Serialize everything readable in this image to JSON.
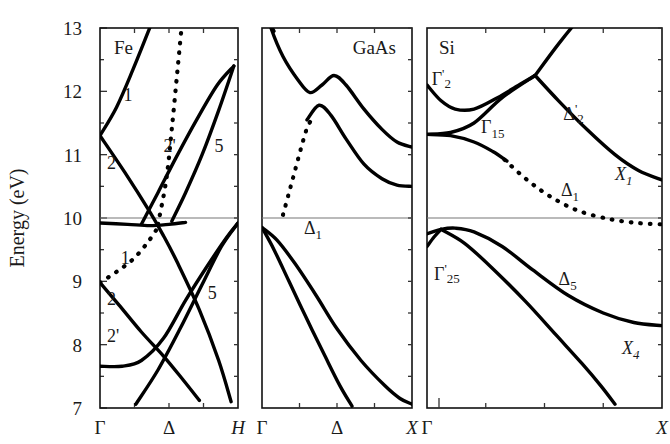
{
  "figure": {
    "y_axis_title": "Energy (eV)",
    "y_ticks": [
      "13",
      "12",
      "11",
      "10",
      "9",
      "8",
      "7"
    ],
    "y_range": [
      7,
      13
    ]
  },
  "chart_data": {
    "type": "line",
    "title": "Energy (eV)",
    "ylabel": "Energy (eV)",
    "xlabel": "",
    "ylim": [
      7,
      13
    ],
    "grid": false,
    "legend": "none",
    "panels": [
      {
        "name": "Fe",
        "xlabel_ticks": [
          "Γ",
          "Δ",
          "H"
        ],
        "x_range": [
          "Γ",
          "H"
        ],
        "annotations": [
          "1",
          "2",
          "2'",
          "5",
          "1",
          "2",
          "2'",
          "5"
        ],
        "series": [
          {
            "name": "Fe-cb-1",
            "style": "solid",
            "points": [
              [
                0.0,
                11.3
              ],
              [
                0.12,
                11.75
              ],
              [
                0.24,
                12.35
              ],
              [
                0.36,
                13.0
              ],
              [
                0.44,
                13.45
              ]
            ]
          },
          {
            "name": "Fe-cb-2",
            "style": "solid",
            "points": [
              [
                0.0,
                11.3
              ],
              [
                0.18,
                10.72
              ],
              [
                0.36,
                10.1
              ],
              [
                0.46,
                9.72
              ],
              [
                0.56,
                9.3
              ],
              [
                0.72,
                8.55
              ],
              [
                0.86,
                7.75
              ],
              [
                0.95,
                7.1
              ]
            ]
          },
          {
            "name": "Fe-cb-2prime",
            "style": "solid",
            "points": [
              [
                0.3,
                9.9
              ],
              [
                0.42,
                10.4
              ],
              [
                0.55,
                10.95
              ],
              [
                0.7,
                11.55
              ],
              [
                0.85,
                12.1
              ],
              [
                0.97,
                12.4
              ]
            ]
          },
          {
            "name": "Fe-cb-5",
            "style": "solid",
            "points": [
              [
                0.52,
                9.95
              ],
              [
                0.62,
                10.4
              ],
              [
                0.74,
                11.0
              ],
              [
                0.86,
                11.7
              ],
              [
                0.97,
                12.4
              ]
            ]
          },
          {
            "name": "Fe-cb-dotted",
            "style": "dotted",
            "points": [
              [
                0.42,
                9.9
              ],
              [
                0.48,
                10.6
              ],
              [
                0.52,
                11.4
              ],
              [
                0.56,
                12.3
              ],
              [
                0.6,
                13.2
              ],
              [
                0.62,
                13.5
              ]
            ]
          },
          {
            "name": "Fe-flat-10",
            "style": "solid",
            "points": [
              [
                0.0,
                9.92
              ],
              [
                0.2,
                9.9
              ],
              [
                0.36,
                9.88
              ],
              [
                0.5,
                9.9
              ],
              [
                0.62,
                9.93
              ]
            ]
          },
          {
            "name": "Fe-vb-1-dotted",
            "style": "dotted",
            "points": [
              [
                0.0,
                8.98
              ],
              [
                0.12,
                9.15
              ],
              [
                0.24,
                9.35
              ],
              [
                0.34,
                9.6
              ],
              [
                0.42,
                9.85
              ]
            ]
          },
          {
            "name": "Fe-vb-2",
            "style": "solid",
            "points": [
              [
                0.0,
                8.98
              ],
              [
                0.14,
                8.62
              ],
              [
                0.3,
                8.2
              ],
              [
                0.46,
                7.82
              ],
              [
                0.6,
                7.45
              ],
              [
                0.72,
                7.12
              ]
            ]
          },
          {
            "name": "Fe-vb-2prime",
            "style": "solid",
            "points": [
              [
                0.0,
                7.66
              ],
              [
                0.16,
                7.66
              ],
              [
                0.3,
                7.75
              ],
              [
                0.46,
                8.1
              ],
              [
                0.62,
                8.7
              ],
              [
                0.78,
                9.25
              ],
              [
                0.92,
                9.7
              ],
              [
                1.0,
                9.92
              ]
            ]
          },
          {
            "name": "Fe-vb-5",
            "style": "solid",
            "points": [
              [
                0.26,
                7.06
              ],
              [
                0.42,
                7.6
              ],
              [
                0.58,
                8.25
              ],
              [
                0.74,
                8.95
              ],
              [
                0.88,
                9.55
              ],
              [
                1.0,
                9.92
              ]
            ]
          }
        ]
      },
      {
        "name": "GaAs",
        "xlabel_ticks": [
          "Γ",
          "Δ",
          "X"
        ],
        "x_range": [
          "Γ",
          "X"
        ],
        "annotations": [
          "Δ1"
        ],
        "band_label": "Δ",
        "band_label_sub": "1",
        "series": [
          {
            "name": "GaAs-cb-upper",
            "style": "solid",
            "points": [
              [
                0.0,
                13.5
              ],
              [
                0.06,
                13.0
              ],
              [
                0.14,
                12.55
              ],
              [
                0.24,
                12.18
              ],
              [
                0.32,
                11.98
              ],
              [
                0.4,
                12.1
              ],
              [
                0.48,
                12.25
              ],
              [
                0.56,
                12.1
              ],
              [
                0.68,
                11.72
              ],
              [
                0.8,
                11.4
              ],
              [
                0.9,
                11.2
              ],
              [
                1.0,
                11.12
              ]
            ]
          },
          {
            "name": "GaAs-cb-upper-left",
            "style": "solid",
            "points": [
              [
                0.0,
                13.5
              ],
              [
                0.05,
                13.1
              ],
              [
                0.08,
                12.95
              ]
            ]
          },
          {
            "name": "GaAs-cb-lower",
            "style": "solid",
            "points": [
              [
                0.3,
                11.55
              ],
              [
                0.38,
                11.78
              ],
              [
                0.46,
                11.62
              ],
              [
                0.56,
                11.25
              ],
              [
                0.68,
                10.85
              ],
              [
                0.8,
                10.62
              ],
              [
                0.9,
                10.52
              ],
              [
                1.0,
                10.5
              ]
            ]
          },
          {
            "name": "GaAs-cb-dotted",
            "style": "dotted",
            "points": [
              [
                0.14,
                10.05
              ],
              [
                0.18,
                10.4
              ],
              [
                0.22,
                10.75
              ],
              [
                0.26,
                11.1
              ],
              [
                0.3,
                11.42
              ],
              [
                0.33,
                11.55
              ]
            ]
          },
          {
            "name": "GaAs-vb-1",
            "style": "solid",
            "points": [
              [
                0.0,
                9.85
              ],
              [
                0.1,
                9.65
              ],
              [
                0.22,
                9.28
              ],
              [
                0.36,
                8.78
              ],
              [
                0.5,
                8.25
              ],
              [
                0.66,
                7.75
              ],
              [
                0.82,
                7.35
              ],
              [
                0.92,
                7.15
              ],
              [
                1.0,
                7.06
              ]
            ]
          },
          {
            "name": "GaAs-vb-2",
            "style": "solid",
            "points": [
              [
                0.0,
                9.85
              ],
              [
                0.08,
                9.5
              ],
              [
                0.18,
                9.0
              ],
              [
                0.3,
                8.4
              ],
              [
                0.42,
                7.82
              ],
              [
                0.52,
                7.35
              ],
              [
                0.6,
                7.03
              ]
            ]
          }
        ]
      },
      {
        "name": "Si",
        "xlabel_ticks": [
          "Γ",
          "X"
        ],
        "x_range": [
          "Γ",
          "X"
        ],
        "annotations": [
          "Γ'2",
          "Γ15",
          "Δ'2",
          "Δ1",
          "X1",
          "Γ'25",
          "Δ5",
          "X4"
        ],
        "series": [
          {
            "name": "Si-cb-gamma2prime",
            "style": "solid",
            "points": [
              [
                0.0,
                12.1
              ],
              [
                0.06,
                11.85
              ],
              [
                0.12,
                11.72
              ],
              [
                0.2,
                11.72
              ],
              [
                0.3,
                11.9
              ],
              [
                0.4,
                12.12
              ],
              [
                0.46,
                12.25
              ]
            ]
          },
          {
            "name": "Si-cb-rising",
            "style": "solid",
            "points": [
              [
                0.46,
                12.25
              ],
              [
                0.56,
                12.75
              ],
              [
                0.66,
                13.2
              ],
              [
                0.74,
                13.5
              ]
            ]
          },
          {
            "name": "Si-cb-gamma15-up",
            "style": "solid",
            "points": [
              [
                0.0,
                11.32
              ],
              [
                0.1,
                11.35
              ],
              [
                0.2,
                11.5
              ],
              [
                0.32,
                11.9
              ],
              [
                0.46,
                12.25
              ]
            ]
          },
          {
            "name": "Si-cb-delta2prime",
            "style": "solid",
            "points": [
              [
                0.46,
                12.25
              ],
              [
                0.56,
                11.85
              ],
              [
                0.68,
                11.4
              ],
              [
                0.8,
                11.0
              ],
              [
                0.9,
                10.75
              ],
              [
                1.0,
                10.6
              ]
            ]
          },
          {
            "name": "Si-cb-gamma15-down",
            "style": "solid",
            "points": [
              [
                0.0,
                11.32
              ],
              [
                0.1,
                11.3
              ],
              [
                0.2,
                11.2
              ],
              [
                0.28,
                11.05
              ],
              [
                0.34,
                10.9
              ]
            ]
          },
          {
            "name": "Si-cb-delta1-dotted",
            "style": "dotted",
            "points": [
              [
                0.33,
                10.92
              ],
              [
                0.42,
                10.62
              ],
              [
                0.52,
                10.35
              ],
              [
                0.64,
                10.12
              ],
              [
                0.78,
                9.98
              ],
              [
                0.9,
                9.92
              ],
              [
                1.0,
                9.9
              ]
            ]
          },
          {
            "name": "Si-vb-gamma25prime-upper",
            "style": "solid",
            "points": [
              [
                0.0,
                9.75
              ],
              [
                0.06,
                9.82
              ],
              [
                0.12,
                9.84
              ],
              [
                0.2,
                9.78
              ],
              [
                0.32,
                9.55
              ],
              [
                0.45,
                9.18
              ],
              [
                0.6,
                8.78
              ],
              [
                0.75,
                8.5
              ],
              [
                0.88,
                8.35
              ],
              [
                1.0,
                8.3
              ]
            ]
          },
          {
            "name": "Si-vb-gamma25prime-lower",
            "style": "solid",
            "points": [
              [
                0.06,
                9.82
              ],
              [
                0.16,
                9.6
              ],
              [
                0.28,
                9.2
              ],
              [
                0.42,
                8.68
              ],
              [
                0.55,
                8.15
              ],
              [
                0.66,
                7.7
              ],
              [
                0.74,
                7.35
              ],
              [
                0.8,
                7.06
              ]
            ]
          },
          {
            "name": "Si-vb-left-edge",
            "style": "solid",
            "points": [
              [
                0.0,
                9.55
              ],
              [
                0.03,
                9.7
              ],
              [
                0.06,
                9.82
              ]
            ]
          }
        ]
      }
    ]
  },
  "panels": [
    {
      "title": "Fe",
      "x_ticks": [
        "Γ",
        "Δ",
        "H"
      ],
      "labels": [
        {
          "text": "1",
          "x": 0.17,
          "y": 11.85
        },
        {
          "text": "2",
          "x": 0.05,
          "y": 10.78
        },
        {
          "text": "2'",
          "x": 0.46,
          "y": 11.05
        },
        {
          "text": "5",
          "x": 0.83,
          "y": 11.05
        },
        {
          "text": "1",
          "x": 0.15,
          "y": 9.28
        },
        {
          "text": "2",
          "x": 0.05,
          "y": 8.62
        },
        {
          "text": "2'",
          "x": 0.05,
          "y": 8.05
        },
        {
          "text": "5",
          "x": 0.78,
          "y": 8.72
        }
      ]
    },
    {
      "title": "GaAs",
      "x_ticks": [
        "Γ",
        "Δ",
        "X"
      ],
      "labels": [
        {
          "text": "Δ",
          "sub": "1",
          "x": 0.28,
          "y": 9.75,
          "italic": false
        }
      ]
    },
    {
      "title": "Si",
      "x_ticks": [
        "Γ",
        "X"
      ],
      "labels": [
        {
          "text": "Γ",
          "sup": "'",
          "sub": "2",
          "x": 0.02,
          "y": 12.1
        },
        {
          "text": "Γ",
          "sub": "15",
          "x": 0.23,
          "y": 11.35
        },
        {
          "text": "Δ",
          "sup": "'",
          "sub": "2",
          "x": 0.58,
          "y": 11.55
        },
        {
          "text": "Δ",
          "sub": "1",
          "x": 0.57,
          "y": 10.35
        },
        {
          "text": "X",
          "sub": "1",
          "x": 0.8,
          "y": 10.6,
          "italic": true
        },
        {
          "text": "Γ",
          "sup": "'",
          "sub": "25",
          "x": 0.03,
          "y": 9.02
        },
        {
          "text": "Δ",
          "sub": "5",
          "x": 0.56,
          "y": 8.95
        },
        {
          "text": "X",
          "sub": "4",
          "x": 0.83,
          "y": 7.85,
          "italic": true
        }
      ]
    }
  ]
}
